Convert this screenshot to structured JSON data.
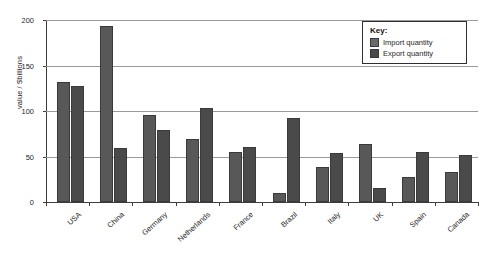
{
  "chart_data": {
    "type": "bar",
    "title": "",
    "xlabel": "",
    "ylabel": "value / $billions",
    "ylim": [
      0,
      200
    ],
    "yticks": [
      0,
      50,
      100,
      150,
      200
    ],
    "grid": true,
    "legend_position": "top-right",
    "categories": [
      "USA",
      "China",
      "Germany",
      "Netherlands",
      "France",
      "Brazil",
      "Italy",
      "UK",
      "Spain",
      "Canada"
    ],
    "series": [
      {
        "name": "Import quantity",
        "color": "#585858",
        "values": [
          132,
          193,
          96,
          69,
          55,
          10,
          38,
          64,
          28,
          33
        ]
      },
      {
        "name": "Export quantity",
        "color": "#4a4a4a",
        "values": [
          128,
          59,
          79,
          103,
          60,
          92,
          54,
          15,
          55,
          52
        ]
      }
    ]
  },
  "legend": {
    "title": "Key:",
    "entries": [
      {
        "label": "Import quantity",
        "swatch": "import-swatch"
      },
      {
        "label": "Export quantity",
        "swatch": "export-swatch"
      }
    ]
  }
}
